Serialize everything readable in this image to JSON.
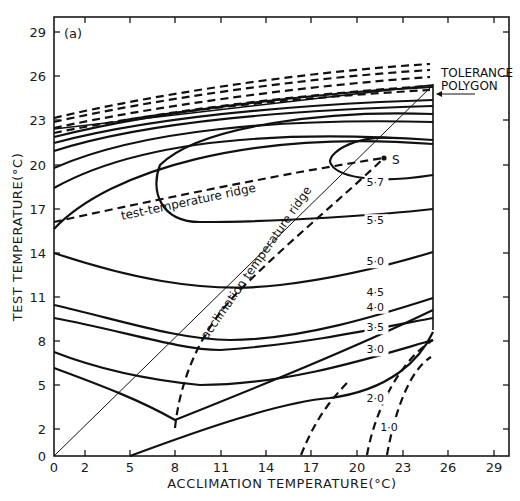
{
  "chart_data": {
    "type": "contour",
    "panel_label": "(a)",
    "title": "",
    "xlabel": "ACCLIMATION TEMPERATURE(°C)",
    "ylabel": "TEST TEMPERATURE(°C)",
    "xlim": [
      0,
      29
    ],
    "ylim": [
      0,
      29
    ],
    "grid": false,
    "x_ticks": [
      0,
      2,
      5,
      8,
      11,
      14,
      17,
      20,
      23,
      26,
      29
    ],
    "y_ticks": [
      0,
      2,
      5,
      8,
      11,
      14,
      17,
      20,
      23,
      26,
      29
    ],
    "x_tick_px": [
      54,
      85,
      130,
      175,
      221,
      266,
      311,
      357,
      403,
      448,
      494
    ],
    "y_tick_px": [
      456,
      429,
      385,
      341,
      297,
      253,
      209,
      165,
      120,
      76,
      32
    ],
    "contour_labels": [
      "5·7",
      "5·5",
      "5·0",
      "4·5",
      "4·0",
      "3·5",
      "3·0",
      "2·0",
      "1·0"
    ],
    "contour_levels": [
      5.7,
      5.5,
      5.0,
      4.5,
      4.0,
      3.5,
      3.0,
      2.0,
      1.0
    ],
    "annotations": {
      "tolerance_line1": "TOLERANCE",
      "tolerance_line2": "POLYGON",
      "test_ridge": "test-temperature ridge",
      "accl_ridge": "acclimation temperature ridge",
      "optimum_point": "S"
    },
    "optimum_point": {
      "acclimation": 21.9,
      "test": 20.4
    },
    "tolerance_polygon": [
      [
        0,
        0
      ],
      [
        0,
        22.3
      ],
      [
        25,
        25.4
      ],
      [
        25,
        8.6
      ],
      [
        8,
        0
      ]
    ],
    "test_temperature_ridge": [
      [
        0,
        16
      ],
      [
        8,
        17.8
      ],
      [
        16,
        19.3
      ],
      [
        21.9,
        20.4
      ]
    ],
    "acclimation_temperature_ridge": [
      [
        8,
        2
      ],
      [
        10,
        8
      ],
      [
        14,
        13.6
      ],
      [
        18,
        17.2
      ],
      [
        21.9,
        20.4
      ]
    ],
    "series": [
      {
        "name": "5.7",
        "style": "solid",
        "label_pos": [
          20.6,
          18.4
        ]
      },
      {
        "name": "5.5",
        "style": "solid",
        "label_pos": [
          20.6,
          15.8
        ]
      },
      {
        "name": "5.0",
        "style": "solid",
        "label_pos": [
          20.6,
          13.0
        ]
      },
      {
        "name": "4.5",
        "style": "solid",
        "label_pos": [
          20.6,
          10.9
        ]
      },
      {
        "name": "4.0",
        "style": "solid",
        "label_pos": [
          20.6,
          9.9
        ]
      },
      {
        "name": "3.5",
        "style": "solid",
        "label_pos": [
          20.6,
          8.5
        ]
      },
      {
        "name": "3.0",
        "style": "solid",
        "label_pos": [
          20.6,
          7.0
        ]
      },
      {
        "name": "2.0",
        "style": "dashed",
        "label_pos": [
          20.6,
          3.7
        ]
      },
      {
        "name": "1.0",
        "style": "dashed",
        "label_pos": [
          21.5,
          1.7
        ]
      }
    ]
  }
}
